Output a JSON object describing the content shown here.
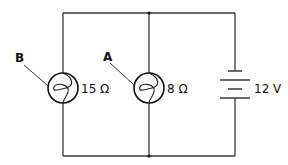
{
  "diagram": {
    "type": "circuit",
    "components": [
      {
        "id": "B",
        "label": "B",
        "kind": "lamp",
        "resistance": "15 Ω"
      },
      {
        "id": "A",
        "label": "A",
        "kind": "lamp",
        "resistance": "8 Ω"
      },
      {
        "id": "battery",
        "kind": "battery",
        "voltage": "12 V"
      }
    ],
    "colors": {
      "line": "#3a3a3a",
      "text": "#111111",
      "background": "#ffffff"
    }
  }
}
